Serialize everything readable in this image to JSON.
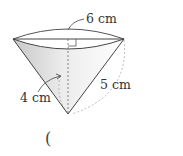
{
  "figure": {
    "type": "cone",
    "labels": {
      "top_diameter": "6 cm",
      "slant_height": "5 cm",
      "height": "4 cm"
    },
    "answer_blank": "("
  },
  "colors": {
    "stroke": "#444444",
    "fill": "#d9d9d9",
    "dashed": "#999999"
  }
}
